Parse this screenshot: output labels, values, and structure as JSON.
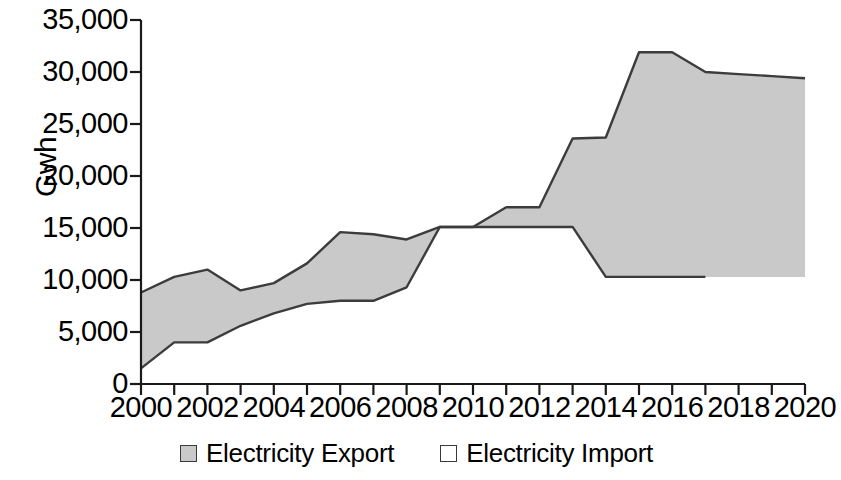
{
  "chart_data": {
    "type": "area",
    "title": "",
    "subtitle": "",
    "xlabel": "",
    "ylabel": "Gwh",
    "xlim": [
      2000,
      2020
    ],
    "ylim": [
      0,
      35000
    ],
    "grid": false,
    "legend_position": "bottom",
    "x": [
      2000,
      2001,
      2002,
      2003,
      2004,
      2005,
      2006,
      2007,
      2008,
      2009,
      2010,
      2011,
      2012,
      2013,
      2014,
      2015,
      2016,
      2017,
      2018,
      2019,
      2020
    ],
    "xticks": [
      "2000",
      "2002",
      "2004",
      "2006",
      "2008",
      "2010",
      "2012",
      "2014",
      "2016",
      "2018",
      "2020"
    ],
    "yticks": [
      "0",
      "5,000",
      "10,000",
      "15,000",
      "20,000",
      "25,000",
      "30,000",
      "35,000"
    ],
    "ytick_values": [
      0,
      5000,
      10000,
      15000,
      20000,
      25000,
      30000,
      35000
    ],
    "series": [
      {
        "name": "Electricity Export",
        "color": "#c9c9c9",
        "values": [
          8800,
          10300,
          11000,
          9000,
          9700,
          11600,
          14600,
          14400,
          13900,
          15100,
          15100,
          17000,
          17000,
          23600,
          23700,
          31900,
          31900,
          30000,
          29800,
          29600,
          29400
        ]
      },
      {
        "name": "Electricity Import",
        "color": "#ffffff",
        "values": [
          1500,
          4000,
          4000,
          5600,
          6800,
          7700,
          8000,
          8000,
          9300,
          15100,
          15100,
          15100,
          15100,
          15100,
          10300,
          10300,
          10300,
          10300,
          10300,
          10300,
          10300
        ]
      }
    ]
  },
  "legend": {
    "items": [
      {
        "label": "Electricity Export",
        "style": "filled"
      },
      {
        "label": "Electricity Import",
        "style": "hollow"
      }
    ]
  }
}
